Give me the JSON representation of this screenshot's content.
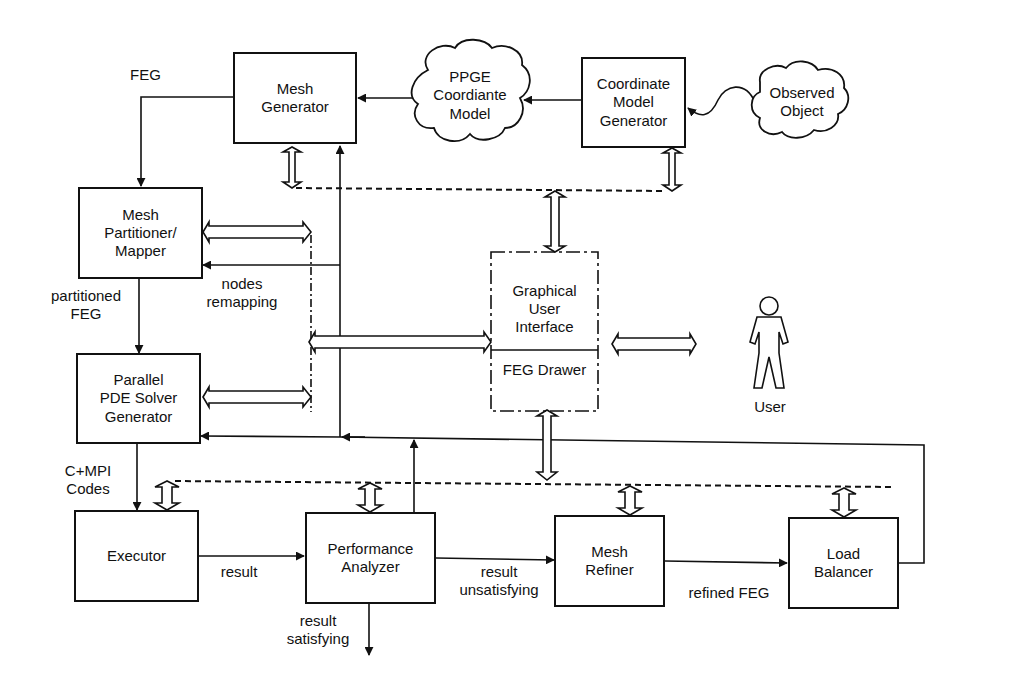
{
  "diagram": {
    "type": "system architecture flow diagram",
    "nodes": {
      "mesh_generator": "Mesh\nGenerator",
      "ppge_model": "PPGE\nCoordiante\nModel",
      "coordinate_model_generator": "Coordinate\nModel\nGenerator",
      "observed_object": "Observed\nObject",
      "mesh_partitioner": "Mesh\nPartitioner/\nMapper",
      "parallel_pde": "Parallel\nPDE Solver\nGenerator",
      "gui": "Graphical\nUser\nInterface",
      "feg_drawer": "FEG Drawer",
      "user": "User",
      "executor": "Executor",
      "performance_analyzer": "Performance\nAnalyzer",
      "mesh_refiner": "Mesh\nRefiner",
      "load_balancer": "Load\nBalancer"
    },
    "edge_labels": {
      "feg": "FEG",
      "partitioned_feg": "partitioned\nFEG",
      "nodes_remapping": "nodes\nremapping",
      "cmpi_codes": "C+MPI\nCodes",
      "result": "result",
      "result_unsatisfying": "result\nunsatisfying",
      "result_satisfying": "result\nsatisfying",
      "refined_feg": "refined FEG"
    },
    "edges": [
      {
        "from": "Coordinate Model Generator",
        "to": "PPGE Coordiante Model"
      },
      {
        "from": "PPGE Coordiante Model",
        "to": "Mesh Generator"
      },
      {
        "from": "Observed Object",
        "to": "Coordinate Model Generator"
      },
      {
        "from": "Mesh Generator",
        "to": "Mesh Partitioner/Mapper",
        "label": "FEG"
      },
      {
        "from": "Mesh Partitioner/Mapper",
        "to": "Parallel PDE Solver Generator",
        "label": "partitioned FEG"
      },
      {
        "from": "Parallel PDE Solver Generator",
        "to": "Executor",
        "label": "C+MPI Codes"
      },
      {
        "from": "Executor",
        "to": "Performance Analyzer",
        "label": "result"
      },
      {
        "from": "Performance Analyzer",
        "to": "Mesh Refiner",
        "label": "result unsatisfying"
      },
      {
        "from": "Performance Analyzer",
        "to": "exit",
        "label": "result satisfying"
      },
      {
        "from": "Mesh Refiner",
        "to": "Load Balancer",
        "label": "refined FEG"
      },
      {
        "from": "Load Balancer",
        "to": "Parallel PDE Solver Generator"
      },
      {
        "from": "Performance Analyzer",
        "to": "Mesh Generator"
      },
      {
        "from": "bus",
        "to": "Mesh Partitioner/Mapper",
        "label": "nodes remapping"
      },
      {
        "from": "Graphical User Interface",
        "to": "User",
        "bidirectional": true
      }
    ]
  }
}
